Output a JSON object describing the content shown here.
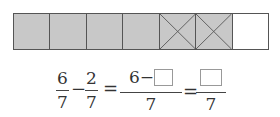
{
  "figure": {
    "bar": {
      "total_cells": 7,
      "cells": [
        {
          "state": "shaded",
          "crossed": false
        },
        {
          "state": "shaded",
          "crossed": false
        },
        {
          "state": "shaded",
          "crossed": false
        },
        {
          "state": "shaded",
          "crossed": false
        },
        {
          "state": "shaded",
          "crossed": true
        },
        {
          "state": "shaded",
          "crossed": true
        },
        {
          "state": "empty",
          "crossed": false
        }
      ],
      "colors": {
        "shaded": "#c8c8c8",
        "empty": "#ffffff",
        "border": "#555555"
      }
    },
    "equation": {
      "term1": {
        "numerator": "6",
        "denominator": "7"
      },
      "operator1": "−",
      "term2": {
        "numerator": "2",
        "denominator": "7"
      },
      "equals1": "=",
      "term3": {
        "numerator_prefix": "6−",
        "numerator_blank": "",
        "denominator": "7"
      },
      "equals2": "=",
      "term4": {
        "numerator_blank": "",
        "denominator": "7"
      }
    }
  }
}
